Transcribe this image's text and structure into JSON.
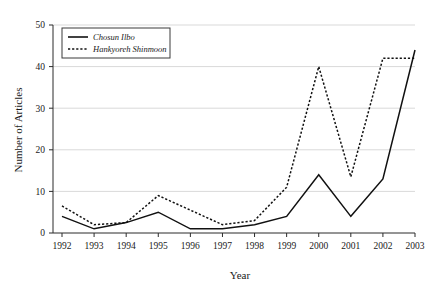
{
  "chart_data": {
    "type": "line",
    "title": "",
    "xlabel": "Year",
    "ylabel": "Number of Articles",
    "categories": [
      "1992",
      "1993",
      "1994",
      "1995",
      "1996",
      "1997",
      "1998",
      "1999",
      "2000",
      "2001",
      "2002",
      "2003"
    ],
    "x": [
      1992,
      1993,
      1994,
      1995,
      1996,
      1997,
      1998,
      1999,
      2000,
      2001,
      2002,
      2003
    ],
    "xlim": [
      1992,
      2003
    ],
    "ylim": [
      0,
      50
    ],
    "yticks": [
      0,
      10,
      20,
      30,
      40,
      50
    ],
    "ytick_labels": [
      "0",
      "10",
      "20",
      "30",
      "40",
      "50"
    ],
    "grid": true,
    "grid_axis": "y",
    "legend_position": "top-left",
    "series": [
      {
        "name": "Chosun Ilbo",
        "style": "solid",
        "color": "#111111",
        "values": [
          4,
          1,
          2.5,
          5,
          1,
          1,
          2,
          4,
          14,
          4,
          13,
          44
        ]
      },
      {
        "name": "Hankyoreh Shinmoon",
        "style": "dotted",
        "color": "#111111",
        "values": [
          6.5,
          2,
          2.5,
          9,
          5.5,
          2,
          3,
          11,
          40,
          13.5,
          42,
          42
        ]
      }
    ]
  },
  "legend": {
    "entries": [
      {
        "label": "Chosun Ilbo",
        "style": "solid"
      },
      {
        "label": "Hankyoreh Shinmoon",
        "style": "dotted"
      }
    ]
  }
}
